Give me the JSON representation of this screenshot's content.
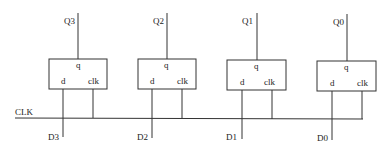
{
  "diagram": {
    "clock_label": "CLK",
    "flipflops": [
      {
        "q_label": "Q3",
        "d_label": "D3",
        "pin_q": "q",
        "pin_d": "d",
        "pin_clk": "clk"
      },
      {
        "q_label": "Q2",
        "d_label": "D2",
        "pin_q": "q",
        "pin_d": "d",
        "pin_clk": "clk"
      },
      {
        "q_label": "Q1",
        "d_label": "D1",
        "pin_q": "q",
        "pin_d": "d",
        "pin_clk": "clk"
      },
      {
        "q_label": "Q0",
        "d_label": "D0",
        "pin_q": "q",
        "pin_d": "d",
        "pin_clk": "clk"
      }
    ]
  }
}
